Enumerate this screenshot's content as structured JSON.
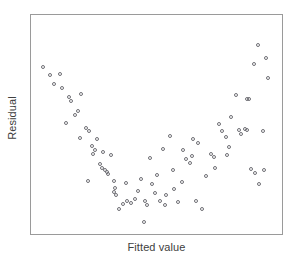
{
  "chart_data": {
    "type": "scatter",
    "title": "",
    "xlabel": "Fitted value",
    "ylabel": "Residual",
    "grid": false,
    "legend": null,
    "xlim": [
      0,
      100
    ],
    "ylim": [
      0,
      100
    ],
    "axis_ticks": {
      "x": [],
      "y": []
    },
    "marker": {
      "shape": "open-circle",
      "size_px": 4,
      "edge_color": "#6f6f75",
      "fill": "none"
    },
    "frame_color": "#9a9a9a",
    "annotation": "U-shaped (curvilinear) residual pattern indicating model misspecification",
    "n_points": 88,
    "points": [
      {
        "x": 3.2,
        "y": 78.7
      },
      {
        "x": 6.3,
        "y": 74.7
      },
      {
        "x": 10.3,
        "y": 75.1
      },
      {
        "x": 7.9,
        "y": 70.1
      },
      {
        "x": 14.2,
        "y": 63.8
      },
      {
        "x": 15.0,
        "y": 62.0
      },
      {
        "x": 19.4,
        "y": 65.6
      },
      {
        "x": 17.8,
        "y": 57.0
      },
      {
        "x": 13.0,
        "y": 51.1
      },
      {
        "x": 21.3,
        "y": 48.9
      },
      {
        "x": 22.5,
        "y": 47.5
      },
      {
        "x": 26.1,
        "y": 43.4
      },
      {
        "x": 23.7,
        "y": 39.8
      },
      {
        "x": 25.3,
        "y": 38.0
      },
      {
        "x": 24.1,
        "y": 36.2
      },
      {
        "x": 28.5,
        "y": 37.1
      },
      {
        "x": 31.6,
        "y": 35.7
      },
      {
        "x": 27.3,
        "y": 31.2
      },
      {
        "x": 28.1,
        "y": 29.4
      },
      {
        "x": 30.0,
        "y": 27.1
      },
      {
        "x": 30.4,
        "y": 26.2
      },
      {
        "x": 22.1,
        "y": 23.1
      },
      {
        "x": 33.2,
        "y": 22.7
      },
      {
        "x": 33.6,
        "y": 19.5
      },
      {
        "x": 33.2,
        "y": 17.7
      },
      {
        "x": 37.9,
        "y": 21.8
      },
      {
        "x": 38.7,
        "y": 13.2
      },
      {
        "x": 40.3,
        "y": 12.3
      },
      {
        "x": 41.9,
        "y": 14.1
      },
      {
        "x": 35.2,
        "y": 9.1
      },
      {
        "x": 44.2,
        "y": 24.0
      },
      {
        "x": 46.2,
        "y": 13.1
      },
      {
        "x": 47.0,
        "y": 11.3
      },
      {
        "x": 45.5,
        "y": 3.0
      },
      {
        "x": 49.0,
        "y": 21.3
      },
      {
        "x": 51.0,
        "y": 25.8
      },
      {
        "x": 52.2,
        "y": 13.2
      },
      {
        "x": 55.0,
        "y": 16.3
      },
      {
        "x": 53.4,
        "y": 38.6
      },
      {
        "x": 57.7,
        "y": 28.5
      },
      {
        "x": 58.1,
        "y": 19.1
      },
      {
        "x": 59.7,
        "y": 12.8
      },
      {
        "x": 61.3,
        "y": 22.4
      },
      {
        "x": 63.2,
        "y": 33.6
      },
      {
        "x": 64.8,
        "y": 31.8
      },
      {
        "x": 66.0,
        "y": 43.4
      },
      {
        "x": 68.4,
        "y": 41.6
      },
      {
        "x": 67.2,
        "y": 13.0
      },
      {
        "x": 70.0,
        "y": 9.3
      },
      {
        "x": 71.5,
        "y": 25.3
      },
      {
        "x": 73.5,
        "y": 36.3
      },
      {
        "x": 75.1,
        "y": 34.5
      },
      {
        "x": 75.5,
        "y": 29.1
      },
      {
        "x": 77.1,
        "y": 50.7
      },
      {
        "x": 78.3,
        "y": 47.1
      },
      {
        "x": 79.8,
        "y": 44.4
      },
      {
        "x": 82.2,
        "y": 54.3
      },
      {
        "x": 81.0,
        "y": 39.5
      },
      {
        "x": 85.3,
        "y": 48.0
      },
      {
        "x": 86.1,
        "y": 45.8
      },
      {
        "x": 87.7,
        "y": 48.4
      },
      {
        "x": 88.5,
        "y": 48.0
      },
      {
        "x": 89.7,
        "y": 62.9
      },
      {
        "x": 84.1,
        "y": 65.1
      },
      {
        "x": 90.5,
        "y": 28.6
      },
      {
        "x": 92.1,
        "y": 26.8
      },
      {
        "x": 93.7,
        "y": 21.3
      },
      {
        "x": 95.2,
        "y": 47.5
      },
      {
        "x": 96.0,
        "y": 28.3
      },
      {
        "x": 96.8,
        "y": 82.9
      },
      {
        "x": 97.6,
        "y": 73.0
      },
      {
        "x": 93.3,
        "y": 89.2
      },
      {
        "x": 91.7,
        "y": 80.1
      },
      {
        "x": 88.9,
        "y": 62.9
      },
      {
        "x": 34.0,
        "y": 15.9
      },
      {
        "x": 43.0,
        "y": 18.0
      },
      {
        "x": 48.2,
        "y": 34.0
      },
      {
        "x": 56.5,
        "y": 44.8
      },
      {
        "x": 62.0,
        "y": 38.0
      },
      {
        "x": 16.6,
        "y": 55.2
      },
      {
        "x": 11.1,
        "y": 68.3
      },
      {
        "x": 19.0,
        "y": 44.0
      },
      {
        "x": 29.2,
        "y": 28.3
      },
      {
        "x": 36.7,
        "y": 11.5
      },
      {
        "x": 50.2,
        "y": 17.0
      },
      {
        "x": 65.6,
        "y": 35.0
      },
      {
        "x": 80.2,
        "y": 35.4
      },
      {
        "x": 54.2,
        "y": 11.4
      }
    ]
  }
}
